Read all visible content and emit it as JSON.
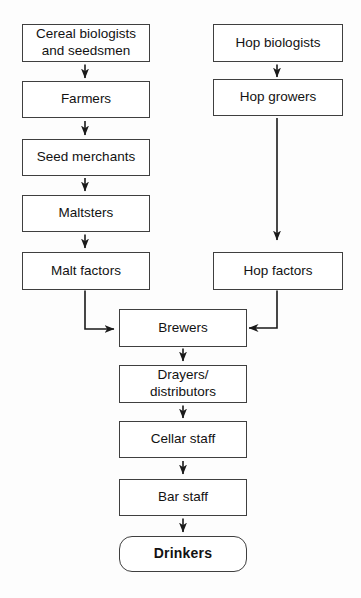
{
  "diagram": {
    "type": "flowchart",
    "nodes": {
      "cereal_biologists": {
        "label": "Cereal biologists\nand seedsmen"
      },
      "farmers": {
        "label": "Farmers"
      },
      "seed_merchants": {
        "label": "Seed merchants"
      },
      "maltsters": {
        "label": "Maltsters"
      },
      "malt_factors": {
        "label": "Malt factors"
      },
      "hop_biologists": {
        "label": "Hop biologists"
      },
      "hop_growers": {
        "label": "Hop growers"
      },
      "hop_factors": {
        "label": "Hop factors"
      },
      "brewers": {
        "label": "Brewers"
      },
      "drayers": {
        "label": "Drayers/\ndistributors"
      },
      "cellar_staff": {
        "label": "Cellar staff"
      },
      "bar_staff": {
        "label": "Bar staff"
      },
      "drinkers": {
        "label": "Drinkers"
      }
    },
    "edges": [
      {
        "from": "cereal_biologists",
        "to": "farmers"
      },
      {
        "from": "farmers",
        "to": "seed_merchants"
      },
      {
        "from": "seed_merchants",
        "to": "maltsters"
      },
      {
        "from": "maltsters",
        "to": "malt_factors"
      },
      {
        "from": "malt_factors",
        "to": "brewers"
      },
      {
        "from": "hop_biologists",
        "to": "hop_growers"
      },
      {
        "from": "hop_growers",
        "to": "hop_factors"
      },
      {
        "from": "hop_factors",
        "to": "brewers"
      },
      {
        "from": "brewers",
        "to": "drayers"
      },
      {
        "from": "drayers",
        "to": "cellar_staff"
      },
      {
        "from": "cellar_staff",
        "to": "bar_staff"
      },
      {
        "from": "bar_staff",
        "to": "drinkers"
      }
    ]
  },
  "colors": {
    "background": "#fdfdfd",
    "box_fill": "#ffffff",
    "box_border": "#3f3f3f",
    "arrow": "#1a1a1a",
    "text": "#121212"
  }
}
